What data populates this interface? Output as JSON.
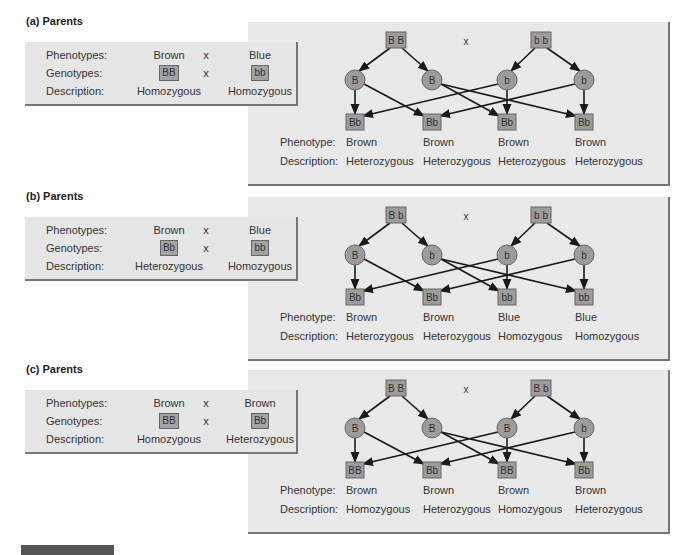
{
  "labels": {
    "phenotypes": "Phenotypes:",
    "genotypes": "Genotypes:",
    "description": "Description:",
    "phenotype": "Phenotype:",
    "cross": "x"
  },
  "colors": {
    "panel_bg": "#e9e9e9",
    "node_fill": "#9c9c9c",
    "node_border": "#666666",
    "arrow": "#1a1a1a",
    "footer_bar": "#555555"
  },
  "panels": [
    {
      "title": "(a)  Parents",
      "parents": {
        "phenotypes": [
          "Brown",
          "Blue"
        ],
        "genotypes": [
          "BB",
          "bb"
        ],
        "descriptions": [
          "Homozygous",
          "Homozygous"
        ]
      },
      "cross": {
        "parent_genotypes": [
          "B B",
          "b b"
        ],
        "gametes": [
          "B",
          "B",
          "b",
          "b"
        ],
        "offspring": [
          {
            "genotype": "Bb",
            "phenotype": "Brown",
            "description": "Heterozygous"
          },
          {
            "genotype": "Bb",
            "phenotype": "Brown",
            "description": "Heterozygous"
          },
          {
            "genotype": "Bb",
            "phenotype": "Brown",
            "description": "Heterozygous"
          },
          {
            "genotype": "Bb",
            "phenotype": "Brown",
            "description": "Heterozygous"
          }
        ]
      }
    },
    {
      "title": "(b)  Parents",
      "parents": {
        "phenotypes": [
          "Brown",
          "Blue"
        ],
        "genotypes": [
          "Bb",
          "bb"
        ],
        "descriptions": [
          "Heterozygous",
          "Homozygous"
        ]
      },
      "cross": {
        "parent_genotypes": [
          "B b",
          "b b"
        ],
        "gametes": [
          "B",
          "b",
          "b",
          "b"
        ],
        "offspring": [
          {
            "genotype": "Bb",
            "phenotype": "Brown",
            "description": "Heterozygous"
          },
          {
            "genotype": "Bb",
            "phenotype": "Brown",
            "description": "Heterozygous"
          },
          {
            "genotype": "bb",
            "phenotype": "Blue",
            "description": "Homozygous"
          },
          {
            "genotype": "bb",
            "phenotype": "Blue",
            "description": "Homozygous"
          }
        ]
      }
    },
    {
      "title": "(c)  Parents",
      "parents": {
        "phenotypes": [
          "Brown",
          "Brown"
        ],
        "genotypes": [
          "BB",
          "Bb"
        ],
        "descriptions": [
          "Homozygous",
          "Heterozygous"
        ]
      },
      "cross": {
        "parent_genotypes": [
          "B B",
          "B b"
        ],
        "gametes": [
          "B",
          "B",
          "B",
          "b"
        ],
        "offspring": [
          {
            "genotype": "BB",
            "phenotype": "Brown",
            "description": "Homozygous"
          },
          {
            "genotype": "Bb",
            "phenotype": "Brown",
            "description": "Heterozygous"
          },
          {
            "genotype": "BB",
            "phenotype": "Brown",
            "description": "Homozygous"
          },
          {
            "genotype": "Bb",
            "phenotype": "Brown",
            "description": "Heterozygous"
          }
        ]
      }
    }
  ]
}
